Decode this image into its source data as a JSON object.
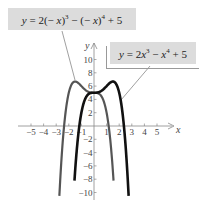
{
  "chart_data": {
    "type": "line",
    "title": "",
    "xlabel": "x",
    "ylabel": "y",
    "xlim": [
      -5.5,
      6
    ],
    "ylim": [
      -10.5,
      12
    ],
    "grid": false,
    "x_ticks": [
      -5,
      -4,
      -3,
      -2,
      -1,
      1,
      2,
      3,
      4,
      5
    ],
    "x_tick_labels": [
      "−5",
      "−4",
      "−3",
      "−2",
      "−1",
      "1",
      "2",
      "3",
      "4",
      "5"
    ],
    "y_ticks": [
      10,
      8,
      6,
      4,
      2,
      -2,
      -4,
      -6,
      -8,
      -10
    ],
    "y_tick_labels": [
      "10",
      "8",
      "6",
      "4",
      "2",
      "−2",
      "−4",
      "−6",
      "−8",
      "−10"
    ],
    "series": [
      {
        "name": "y = 2(−x)^3 − (−x)^4 + 5",
        "label_text": "y = 2(− x)3 − (− x)4 + 5",
        "color": "#555555",
        "width": 2.2,
        "x_range": [
          -2.75,
          1.55
        ],
        "coefficients": {
          "a4": -1,
          "a3": -2,
          "a2": 0,
          "a1": 0,
          "a0": 5
        }
      },
      {
        "name": "y = 2x^3 − x^4 + 5",
        "label_text": "y = 2x3 − x4 + 5",
        "color": "#111111",
        "width": 2.6,
        "x_range": [
          -1.55,
          2.75
        ],
        "coefficients": {
          "a4": -1,
          "a3": 2,
          "a2": 0,
          "a1": 0,
          "a0": 5
        }
      }
    ],
    "annotations": [
      {
        "text": "y = 2(−x)^3 − (−x)^4 + 5",
        "points_to": "gray reflected curve"
      },
      {
        "text": "y = 2x^3 − x^4 + 5",
        "points_to": "black original curve"
      }
    ]
  },
  "labels": {
    "box1": {
      "y": "y",
      "eq": " = 2(− ",
      "x1": "x",
      "p1": ")",
      "e1": "3",
      "mid": " − (− ",
      "x2": "x",
      "p2": ")",
      "e2": "4",
      "tail": " + 5"
    },
    "box2": {
      "y": "y",
      "eq": " = 2",
      "x1": "x",
      "e1": "3",
      "mid": " − ",
      "x2": "x",
      "e2": "4",
      "tail": " + 5"
    }
  }
}
